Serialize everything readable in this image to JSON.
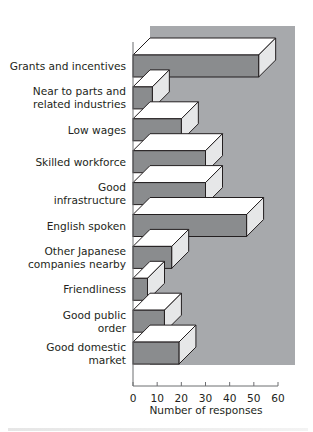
{
  "chart_data": {
    "type": "bar",
    "orientation": "horizontal",
    "style": "3d",
    "title": "",
    "xlabel": "Number of responses",
    "ylabel": "",
    "xlim": [
      0,
      60
    ],
    "xticks": [
      0,
      10,
      20,
      30,
      40,
      50,
      60
    ],
    "grid": false,
    "legend": null,
    "categories": [
      "Grants and incentives",
      "Near to parts and related industries",
      "Low wages",
      "Skilled workforce",
      "Good infrastructure",
      "English spoken",
      "Other Japanese companies nearby",
      "Friendliness",
      "Good public order",
      "Good domestic market"
    ],
    "category_lines": [
      [
        "Grants and incentives"
      ],
      [
        "Near to parts and",
        "related industries"
      ],
      [
        "Low wages"
      ],
      [
        "Skilled workforce"
      ],
      [
        "Good",
        "infrastructure"
      ],
      [
        "English spoken"
      ],
      [
        "Other Japanese",
        "companies nearby"
      ],
      [
        "Friendliness"
      ],
      [
        "Good public",
        "order"
      ],
      [
        "Good domestic",
        "market"
      ]
    ],
    "values": [
      52,
      8,
      20,
      30,
      30,
      47,
      16,
      6,
      13,
      19
    ]
  },
  "colors": {
    "panel": "#a7a9ac",
    "bar_front": "#8a8c8e",
    "bar_top": "#ffffff",
    "bar_side": "#e6e7e8",
    "outline": "#231f20"
  }
}
